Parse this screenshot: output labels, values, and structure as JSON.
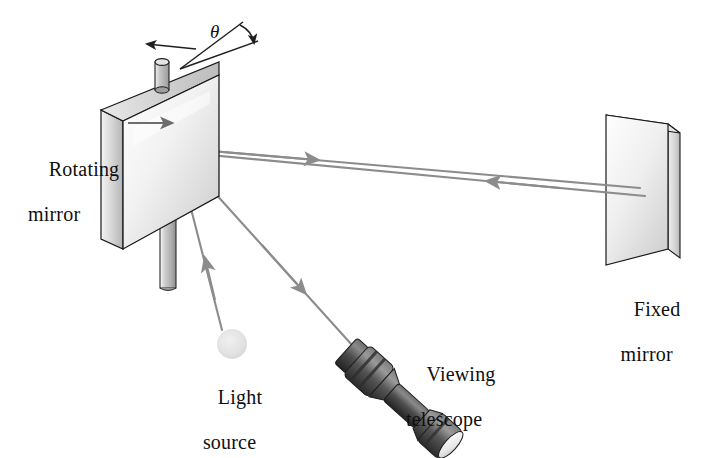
{
  "figure": {
    "kind": "physics-diagram",
    "background_color": "#ffffff"
  },
  "labels": {
    "rotating_mirror_line1": "Rotating",
    "rotating_mirror_line2": "mirror",
    "fixed_mirror_line1": "Fixed",
    "fixed_mirror_line2": "mirror",
    "light_source_line1": "Light",
    "light_source_line2": "source",
    "viewing_telescope_line1": "Viewing",
    "viewing_telescope_line2": "telescope",
    "angle_symbol": "θ"
  },
  "colors": {
    "text": "#100f0f",
    "ray": "#8c8c8c",
    "outline": "#1a1a1a",
    "mirror_face_light": "#ffffff",
    "mirror_face_shadow": "#c8c8c8",
    "mirror_edge": "#d8d8d8",
    "post": "#b9b9b9",
    "telescope_body": "#4a4a4a",
    "telescope_dark": "#262626",
    "light_source_fill": "#e2e2e2"
  },
  "parts": {
    "rotating_mirror": {
      "name": "Rotating mirror",
      "has_vertical_support_post": true,
      "has_top_pivot_cylinder": true,
      "normal_arrow_direction": "right"
    },
    "fixed_mirror": {
      "name": "Fixed mirror"
    },
    "light_source": {
      "name": "Light source",
      "shape": "circle"
    },
    "viewing_telescope": {
      "name": "Viewing telescope",
      "orientation": "diagonal"
    }
  },
  "rays": [
    {
      "id": "source-to-rotating-mirror",
      "from": "Light source",
      "to": "Rotating mirror",
      "direction": "up-left",
      "arrow": "toward-mirror"
    },
    {
      "id": "rotating-mirror-to-fixed-mirror",
      "from": "Rotating mirror",
      "to": "Fixed mirror",
      "direction": "right",
      "arrow": "toward-fixed-mirror"
    },
    {
      "id": "fixed-mirror-to-rotating-mirror",
      "from": "Fixed mirror",
      "to": "Rotating mirror",
      "direction": "left",
      "arrow": "toward-rotating-mirror"
    },
    {
      "id": "rotating-mirror-to-telescope",
      "from": "Rotating mirror",
      "to": "Viewing telescope",
      "direction": "down-right",
      "arrow": "toward-telescope"
    }
  ],
  "annotations": {
    "rotation_angle": {
      "symbol": "θ",
      "description": "angle through which the mirror rotates",
      "has_curved_arrow": true
    }
  }
}
